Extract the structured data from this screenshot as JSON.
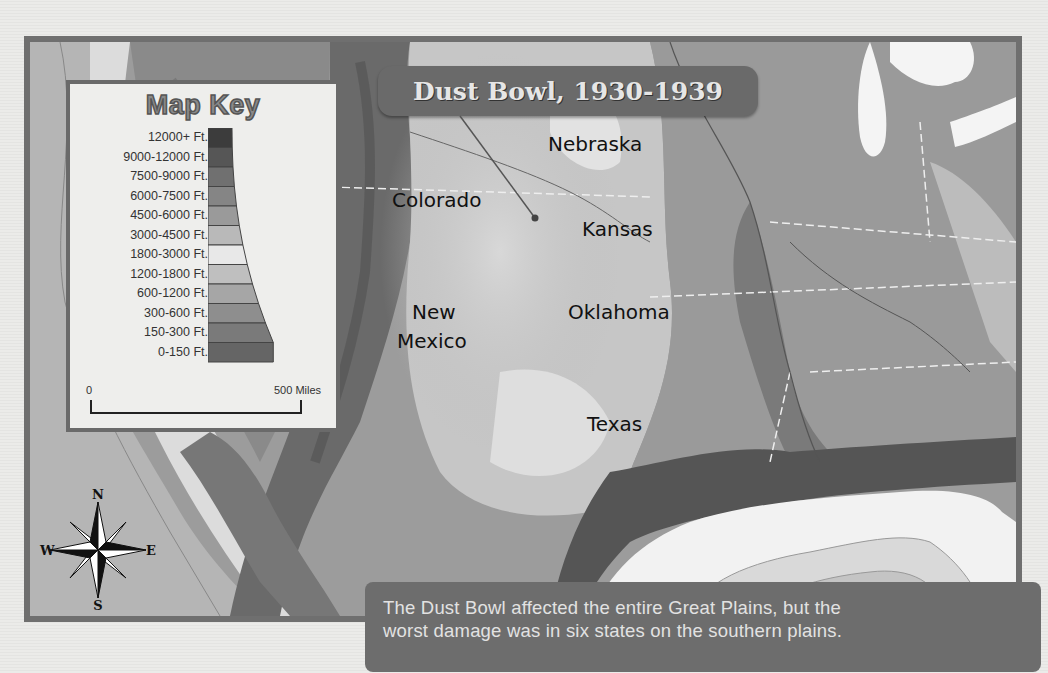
{
  "map": {
    "title": "Dust Bowl, 1930-1939",
    "states": [
      {
        "name": "Nebraska",
        "x": 548,
        "y": 132
      },
      {
        "name": "Colorado",
        "x": 392,
        "y": 188
      },
      {
        "name": "Kansas",
        "x": 582,
        "y": 217
      },
      {
        "name": "New",
        "x": 412,
        "y": 300
      },
      {
        "name": "Mexico",
        "x": 397,
        "y": 329
      },
      {
        "name": "Oklahoma",
        "x": 568,
        "y": 300
      },
      {
        "name": "Texas",
        "x": 587,
        "y": 412
      }
    ],
    "pointer_dot": {
      "x": 535,
      "y": 218
    }
  },
  "legend": {
    "title": "Map Key",
    "entries": [
      {
        "label": "12000+ Ft.",
        "color": "#3c3c3c"
      },
      {
        "label": "9000-12000 Ft.",
        "color": "#565656"
      },
      {
        "label": "7500-9000 Ft.",
        "color": "#707070"
      },
      {
        "label": "6000-7500 Ft.",
        "color": "#858585"
      },
      {
        "label": "4500-6000 Ft.",
        "color": "#9a9a9a"
      },
      {
        "label": "3000-4500 Ft.",
        "color": "#b9b9b9"
      },
      {
        "label": "1800-3000 Ft.",
        "color": "#e8e8e8"
      },
      {
        "label": "1200-1800 Ft.",
        "color": "#bfbfbf"
      },
      {
        "label": "600-1200 Ft.",
        "color": "#a6a6a6"
      },
      {
        "label": "300-600 Ft.",
        "color": "#8e8e8e"
      },
      {
        "label": "150-300 Ft.",
        "color": "#7a7a7a"
      },
      {
        "label": "0-150 Ft.",
        "color": "#656565"
      }
    ],
    "scale": {
      "start": "0",
      "end": "500 Miles"
    }
  },
  "compass": {
    "n": "N",
    "s": "S",
    "e": "E",
    "w": "W"
  },
  "caption": {
    "line1": "The Dust Bowl affected the entire Great Plains, but the",
    "line2": "worst damage was in six states on the southern plains."
  }
}
